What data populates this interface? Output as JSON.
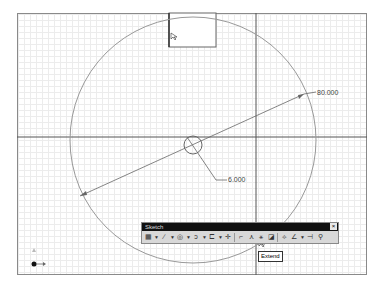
{
  "sketch": {
    "dimensions": [
      {
        "label": "80.000",
        "type": "diameter"
      },
      {
        "label": "6.000",
        "type": "diameter"
      }
    ],
    "circle_large": {
      "cx": 193,
      "cy": 140,
      "r": 123
    },
    "circle_small": {
      "cx": 193,
      "cy": 145,
      "r": 9
    }
  },
  "toolbar": {
    "title": "Sketch",
    "close_icon": "×",
    "tools": [
      {
        "name": "grid-icon",
        "glyph": "▦",
        "dropdown": true
      },
      {
        "name": "line-icon",
        "glyph": "∕",
        "dropdown": true
      },
      {
        "name": "circle-icon",
        "glyph": "◎",
        "dropdown": true
      },
      {
        "name": "arc-icon",
        "glyph": "ↄ",
        "dropdown": true
      },
      {
        "name": "rectangle-icon",
        "glyph": "⊏",
        "dropdown": true
      },
      {
        "name": "point-icon",
        "glyph": "✛",
        "dropdown": false
      },
      {
        "name": "trim-icon",
        "glyph": "⌐",
        "dropdown": false
      },
      {
        "name": "extend-icon",
        "glyph": "⋏",
        "dropdown": false
      },
      {
        "name": "offset-icon",
        "glyph": "⚹",
        "dropdown": false
      },
      {
        "name": "fillet-icon",
        "glyph": "◪",
        "dropdown": false
      },
      {
        "name": "mirror-icon",
        "glyph": "⟡",
        "dropdown": false
      },
      {
        "name": "constraint-icon",
        "glyph": "∠",
        "dropdown": true
      },
      {
        "name": "dimension-icon",
        "glyph": "⊣",
        "dropdown": false
      },
      {
        "name": "project-icon",
        "glyph": "⚲",
        "dropdown": false
      }
    ]
  },
  "tooltip": {
    "text": "Extend"
  }
}
